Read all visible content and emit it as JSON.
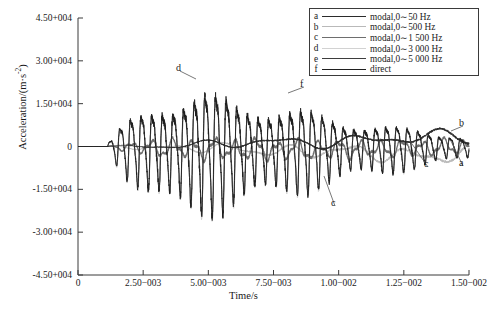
{
  "chart_data": {
    "type": "line",
    "title": "",
    "xlabel": "Time/s",
    "ylabel": "Acceleration/(m·s",
    "ylabel_sup": "-2",
    "ylabel_tail": ")",
    "xlim": [
      0,
      0.015
    ],
    "ylim": [
      -45000,
      45000
    ],
    "grid": false,
    "legend_position": "top-right",
    "xticks": [
      "0",
      "2.50−003",
      "5.00−003",
      "7.50−003",
      "1.00−002",
      "1.25−002",
      "1.50−002"
    ],
    "xtick_values": [
      0,
      0.0025,
      0.005,
      0.0075,
      0.01,
      0.0125,
      0.015
    ],
    "yticks": [
      "4.50+004",
      "3.00+004",
      "1.50+004",
      "0",
      "-1.50+004",
      "-3.00+004",
      "-4.50+004"
    ],
    "ytick_values": [
      45000,
      30000,
      15000,
      0,
      -15000,
      -30000,
      -45000
    ],
    "series": [
      {
        "key": "a",
        "name": "modal,0∼50 Hz",
        "color": "#2b2b2b",
        "width": 0.9,
        "type": "envelope_lf",
        "freq": 330,
        "amp": 2600,
        "phase": 0.4,
        "drift": 1.0
      },
      {
        "key": "b",
        "name": "modal,0∼500 Hz",
        "color": "#b9b9b9",
        "width": 0.9,
        "type": "envelope_lf",
        "freq": 430,
        "amp": 3100,
        "phase": 1.7,
        "drift": -1.0
      },
      {
        "key": "c",
        "name": "modal,0∼1 500 Hz",
        "color": "#6e6e6e",
        "width": 1.2,
        "type": "mid",
        "freq": 1250,
        "amp": 5200,
        "phase": 0.9,
        "drift": 0.3
      },
      {
        "key": "d",
        "name": "modal,0∼3 000 Hz",
        "color": "#d2d2d2",
        "width": 1.0,
        "type": "main",
        "freq": 2450,
        "amp": 21500,
        "phase": 0.0,
        "drift": 0.0
      },
      {
        "key": "e",
        "name": "modal,0∼5 000 Hz",
        "color": "#3d3d3d",
        "width": 0.85,
        "type": "main",
        "freq": 2450,
        "amp": 20800,
        "phase": 0.06,
        "drift": 0.0
      },
      {
        "key": "f",
        "name": "direct",
        "color": "#1f1f1f",
        "width": 0.85,
        "type": "main_rough",
        "freq": 2450,
        "amp": 21200,
        "phase": 0.12,
        "drift": 0.0
      }
    ],
    "annotations": [
      {
        "text": "d",
        "x": 0.00495,
        "y": 33000,
        "tx": 176,
        "ty": 62,
        "px": 196,
        "py": 79
      },
      {
        "text": "f",
        "x": 0.00935,
        "y": 21500,
        "tx": 300,
        "ty": 78,
        "px": 288,
        "py": 93
      },
      {
        "text": "c",
        "x": 0.00855,
        "y": -24000,
        "tx": 331,
        "ty": 197,
        "px": 324,
        "py": 176
      },
      {
        "text": "c",
        "x": 0.0131,
        "y": -6500,
        "tx": 424,
        "ty": 158,
        "px": 410,
        "py": 141
      },
      {
        "text": "b",
        "x": 0.01475,
        "y": 8500,
        "tx": 459,
        "ty": 117,
        "px": 451,
        "py": 131
      },
      {
        "text": "a",
        "x": 0.0149,
        "y": -3500,
        "tx": 459,
        "ty": 157,
        "px": 451,
        "py": 141
      }
    ]
  },
  "legend": {
    "rows": [
      {
        "key": "a",
        "label": "modal,0∼50 Hz"
      },
      {
        "key": "b",
        "label": "modal,0∼500 Hz"
      },
      {
        "key": "c",
        "label": "modal,0∼1 500 Hz"
      },
      {
        "key": "d",
        "label": "modal,0∼3 000 Hz"
      },
      {
        "key": "e",
        "label": "modal,0∼5 000 Hz"
      },
      {
        "key": "f",
        "label": "direct"
      }
    ]
  }
}
